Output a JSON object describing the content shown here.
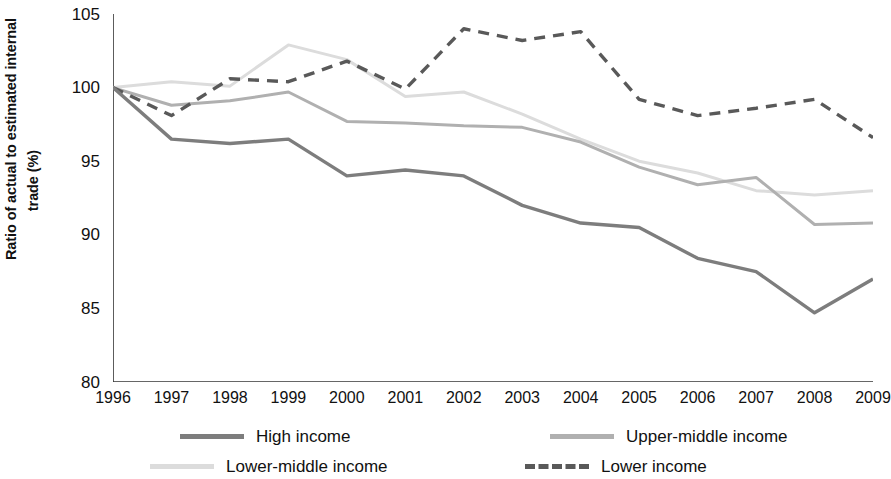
{
  "chart_data": {
    "type": "line",
    "title": "",
    "xlabel": "",
    "ylabel_line1": "Ratio of actual to estimated internal",
    "ylabel_line2": "trade (%)",
    "grid": false,
    "legend_position": "bottom",
    "xlim": [
      1996,
      2009
    ],
    "ylim": [
      80,
      105
    ],
    "ytick_labels": [
      "105",
      "100",
      "95",
      "90",
      "85",
      "80"
    ],
    "ytick_values": [
      105,
      100,
      95,
      90,
      85,
      80
    ],
    "categories": [
      1996,
      1997,
      1998,
      1999,
      2000,
      2001,
      2002,
      2003,
      2004,
      2005,
      2006,
      2007,
      2008,
      2009
    ],
    "xtick_labels": [
      "1996",
      "1997",
      "1998",
      "1999",
      "2000",
      "2001",
      "2002",
      "2003",
      "2004",
      "2005",
      "2006",
      "2007",
      "2008",
      "2009"
    ],
    "series": [
      {
        "name": "High income",
        "color": "#7d7d7d",
        "style": "solid",
        "width": 3.4,
        "values": [
          100.0,
          96.5,
          96.2,
          96.5,
          94.0,
          94.4,
          94.0,
          92.0,
          90.8,
          90.5,
          88.4,
          87.5,
          84.7,
          87.0
        ]
      },
      {
        "name": "Upper-middle income",
        "color": "#b0b0b0",
        "style": "solid",
        "width": 3.0,
        "values": [
          100.0,
          98.8,
          99.1,
          99.7,
          97.7,
          97.6,
          97.4,
          97.3,
          96.3,
          94.6,
          93.4,
          93.9,
          90.7,
          90.8
        ]
      },
      {
        "name": "Lower-middle income",
        "color": "#dcdcdc",
        "style": "solid",
        "width": 3.0,
        "values": [
          100.0,
          100.4,
          100.1,
          102.9,
          101.9,
          99.4,
          99.7,
          98.2,
          96.5,
          95.0,
          94.2,
          93.0,
          92.7,
          93.0
        ]
      },
      {
        "name": "Lower income",
        "color": "#595959",
        "style": "dashed",
        "width": 3.4,
        "values": [
          100.0,
          98.1,
          100.6,
          100.4,
          101.8,
          99.9,
          104.0,
          103.2,
          103.8,
          99.2,
          98.1,
          98.6,
          99.2,
          96.6
        ]
      }
    ]
  },
  "legend": {
    "items": [
      {
        "label": "High income"
      },
      {
        "label": "Upper-middle income"
      },
      {
        "label": "Lower-middle income"
      },
      {
        "label": "Lower income"
      }
    ]
  }
}
